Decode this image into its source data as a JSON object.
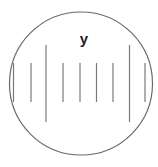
{
  "diagram": {
    "label": "y",
    "colors": {
      "circle_stroke": "#6a6a6a",
      "line_stroke": "#7a7a7a",
      "label": "#222222",
      "background": "#ffffff"
    },
    "circle": {
      "cx": 81,
      "cy": 83.5,
      "r": 71.5
    },
    "lines": [
      {
        "x": 13.5,
        "y1": 63,
        "y2": 102,
        "kind": "short"
      },
      {
        "x": 31,
        "y1": 63,
        "y2": 102,
        "kind": "short"
      },
      {
        "x": 46,
        "y1": 45,
        "y2": 122,
        "kind": "long"
      },
      {
        "x": 63,
        "y1": 63,
        "y2": 102,
        "kind": "short"
      },
      {
        "x": 80,
        "y1": 63,
        "y2": 102,
        "kind": "short"
      },
      {
        "x": 96.5,
        "y1": 63,
        "y2": 102,
        "kind": "short"
      },
      {
        "x": 113,
        "y1": 63,
        "y2": 102,
        "kind": "short"
      },
      {
        "x": 129.5,
        "y1": 45,
        "y2": 122,
        "kind": "long"
      },
      {
        "x": 145,
        "y1": 63,
        "y2": 102,
        "kind": "short"
      }
    ],
    "label_pos": {
      "x": 84,
      "y": 44
    }
  }
}
